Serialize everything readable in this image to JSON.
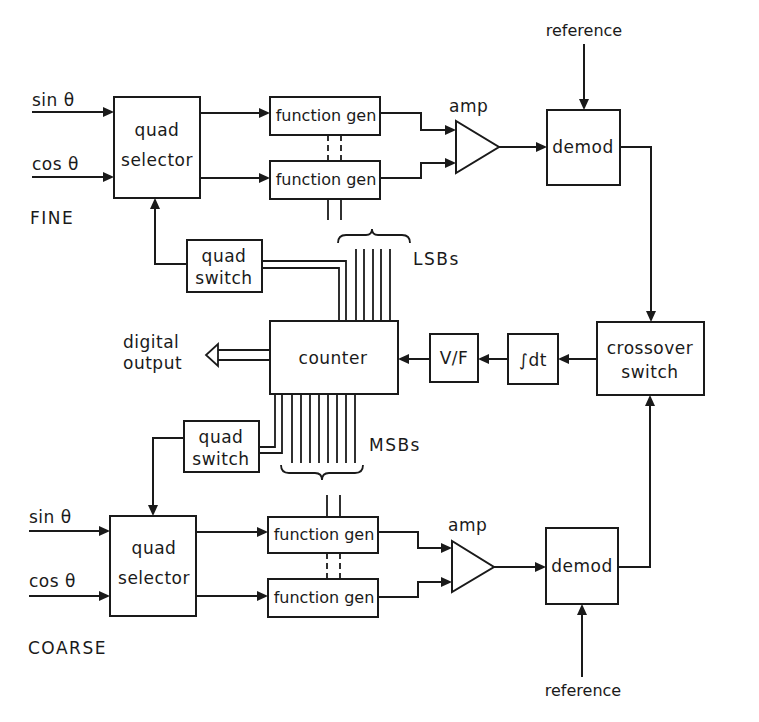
{
  "diagram": {
    "type": "block-diagram",
    "sections": {
      "fine": {
        "label": "FINE",
        "inputs": [
          "sin θ",
          "cos θ"
        ],
        "quad_selector": [
          "quad",
          "selector"
        ],
        "function_gens": [
          "function gen",
          "function gen"
        ],
        "amp": "amp",
        "demod": "demod",
        "reference": "reference",
        "quad_switch": [
          "quad",
          "switch"
        ],
        "bus_label": "LSBs"
      },
      "coarse": {
        "label": "COARSE",
        "inputs": [
          "sin θ",
          "cos θ"
        ],
        "quad_selector": [
          "quad",
          "selector"
        ],
        "function_gens": [
          "function gen",
          "function gen"
        ],
        "amp": "amp",
        "demod": "demod",
        "reference": "reference",
        "quad_switch": [
          "quad",
          "switch"
        ],
        "bus_label": "MSBs"
      },
      "shared": {
        "counter": "counter",
        "vf": "V/F",
        "integrator": "∫dt",
        "crossover_switch": [
          "crossover",
          "switch"
        ],
        "digital_output": [
          "digital",
          "output"
        ]
      }
    },
    "connections": [
      {
        "from": "sin θ (fine)",
        "to": "quad selector (fine)"
      },
      {
        "from": "cos θ (fine)",
        "to": "quad selector (fine)"
      },
      {
        "from": "quad selector (fine)",
        "to": "function gen (fine, top)"
      },
      {
        "from": "quad selector (fine)",
        "to": "function gen (fine, bottom)"
      },
      {
        "from": "function gen (fine, top)",
        "to": "amp (fine)"
      },
      {
        "from": "function gen (fine, bottom)",
        "to": "amp (fine)"
      },
      {
        "from": "amp (fine)",
        "to": "demod (fine)"
      },
      {
        "from": "reference",
        "to": "demod (fine)"
      },
      {
        "from": "demod (fine)",
        "to": "crossover switch"
      },
      {
        "from": "demod (coarse)",
        "to": "crossover switch"
      },
      {
        "from": "crossover switch",
        "to": "∫dt"
      },
      {
        "from": "∫dt",
        "to": "V/F"
      },
      {
        "from": "V/F",
        "to": "counter"
      },
      {
        "from": "counter",
        "to": "digital output"
      },
      {
        "from": "counter (LSBs)",
        "to": "quad switch (fine)"
      },
      {
        "from": "quad switch (fine)",
        "to": "quad selector (fine)"
      },
      {
        "from": "counter (MSBs)",
        "to": "quad switch (coarse)"
      },
      {
        "from": "quad switch (coarse)",
        "to": "quad selector (coarse)"
      },
      {
        "from": "sin θ (coarse)",
        "to": "quad selector (coarse)"
      },
      {
        "from": "cos θ (coarse)",
        "to": "quad selector (coarse)"
      },
      {
        "from": "quad selector (coarse)",
        "to": "function gen (coarse, top)"
      },
      {
        "from": "quad selector (coarse)",
        "to": "function gen (coarse, bottom)"
      },
      {
        "from": "function gen (coarse, top)",
        "to": "amp (coarse)"
      },
      {
        "from": "function gen (coarse, bottom)",
        "to": "amp (coarse)"
      },
      {
        "from": "amp (coarse)",
        "to": "demod (coarse)"
      },
      {
        "from": "reference",
        "to": "demod (coarse)"
      }
    ]
  },
  "colors": {
    "ink": "#1a1a1a",
    "background": "#ffffff"
  }
}
